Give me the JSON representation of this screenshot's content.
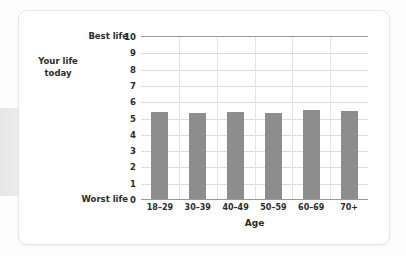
{
  "chart_data": {
    "type": "bar",
    "title": "",
    "categories": [
      "18–29",
      "30–39",
      "40–49",
      "50–59",
      "60–69",
      "70+"
    ],
    "values": [
      5.35,
      5.25,
      5.35,
      5.3,
      5.45,
      5.4
    ],
    "series": [
      {
        "name": "Your life today",
        "values": [
          5.35,
          5.25,
          5.35,
          5.3,
          5.45,
          5.4
        ]
      }
    ],
    "xlabel": "Age",
    "ylabel": "Your life today",
    "ylim": [
      0,
      10
    ],
    "ytick_values": [
      0,
      1,
      2,
      3,
      4,
      5,
      6,
      7,
      8,
      9,
      10
    ],
    "ytick_labels": [
      "0",
      "1",
      "2",
      "3",
      "4",
      "5",
      "6",
      "7",
      "8",
      "9",
      "10"
    ],
    "y_axis_endpoint_labels": {
      "max": "Best life",
      "min": "Worst life"
    },
    "grid": true,
    "grid_orientation": "both",
    "legend": "none",
    "bar_color": "#8d8d8d",
    "gridline_color": "#dcdcdc",
    "axis_color": "#9a9a9a",
    "background_color": "#ffffff"
  },
  "labels": {
    "best_life": "Best life",
    "worst_life": "Worst life",
    "y_axis_title_line1": "Your life",
    "y_axis_title_line2": "today",
    "x_axis_title": "Age"
  }
}
